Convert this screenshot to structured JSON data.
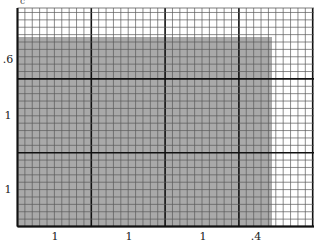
{
  "diagram": {
    "type": "grid-area-model",
    "top_glyph": "c",
    "colors": {
      "background": "#ffffff",
      "shade": "#a9a9a9",
      "minor_line": "#5a5a5a",
      "major_line": "#111111"
    },
    "grid": {
      "origin_x": 17.5,
      "origin_y": 8,
      "right_x": 314,
      "bottom_y": 226.5,
      "major_spacing": 73.8,
      "minor_per_major": 10
    },
    "shaded_region": {
      "x_from": 17.5,
      "x_to": 272,
      "y_from": 37,
      "y_to": 226.5
    },
    "left_labels": [
      {
        "text": ".6",
        "y": 59
      },
      {
        "text": "1",
        "y": 115
      },
      {
        "text": "1",
        "y": 189
      }
    ],
    "bottom_labels": [
      {
        "text": "1",
        "x": 55
      },
      {
        "text": "1",
        "x": 129
      },
      {
        "text": "1",
        "x": 203
      },
      {
        "text": ".4",
        "x": 256
      }
    ]
  }
}
